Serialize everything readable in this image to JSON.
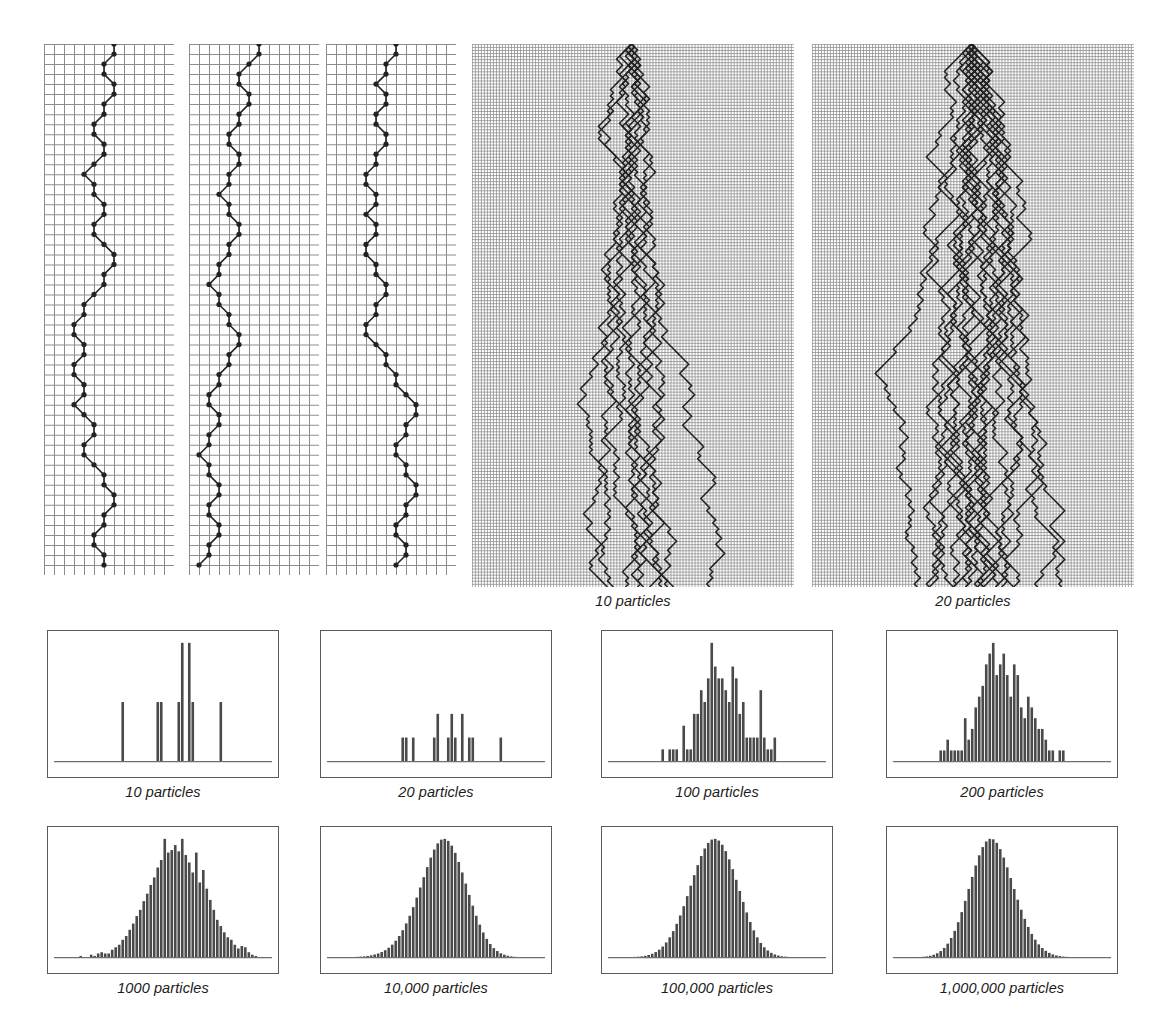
{
  "figure": {
    "ink_color": "#222222",
    "grid_color": "#8c8c8c",
    "bar_color": "#4a4a4a",
    "frame_color": "#5a5a5a",
    "baseline_color": "#6e6e6e"
  },
  "walk_panels": [
    {
      "name": "single-walk-1",
      "caption": "",
      "particles": 1,
      "grid_cols": 13,
      "grid_rows": 53,
      "cell": 10,
      "path": [
        7,
        7,
        6,
        6,
        7,
        7,
        6,
        6,
        5,
        5,
        6,
        6,
        5,
        4,
        5,
        5,
        6,
        6,
        5,
        5,
        6,
        7,
        7,
        6,
        6,
        5,
        4,
        4,
        3,
        3,
        4,
        4,
        3,
        3,
        4,
        4,
        3,
        4,
        5,
        5,
        4,
        4,
        5,
        6,
        6,
        7,
        7,
        6,
        6,
        5,
        5,
        6,
        6
      ]
    },
    {
      "name": "single-walk-2",
      "caption": "",
      "particles": 1,
      "grid_cols": 13,
      "grid_rows": 53,
      "cell": 10,
      "path": [
        7,
        7,
        6,
        5,
        5,
        6,
        6,
        5,
        5,
        4,
        4,
        5,
        5,
        4,
        4,
        3,
        4,
        4,
        5,
        5,
        4,
        4,
        3,
        3,
        2,
        3,
        3,
        4,
        4,
        5,
        5,
        4,
        4,
        3,
        3,
        2,
        2,
        3,
        3,
        2,
        2,
        1,
        2,
        2,
        3,
        3,
        2,
        2,
        3,
        3,
        2,
        2,
        1
      ]
    },
    {
      "name": "single-walk-3",
      "caption": "",
      "particles": 1,
      "grid_cols": 13,
      "grid_rows": 53,
      "cell": 10,
      "path": [
        7,
        7,
        6,
        6,
        5,
        6,
        6,
        5,
        5,
        6,
        6,
        5,
        5,
        4,
        4,
        5,
        5,
        4,
        5,
        5,
        4,
        4,
        5,
        5,
        6,
        6,
        5,
        5,
        4,
        4,
        5,
        6,
        6,
        7,
        7,
        8,
        9,
        9,
        8,
        8,
        7,
        7,
        8,
        8,
        9,
        9,
        8,
        8,
        7,
        7,
        8,
        8,
        7
      ]
    },
    {
      "name": "multi-walk-10",
      "caption": "10 particles",
      "particles": 10,
      "grid_cols": 107,
      "grid_rows": 178,
      "cell": 3
    },
    {
      "name": "multi-walk-20",
      "caption": "20 particles",
      "particles": 20,
      "grid_cols": 107,
      "grid_rows": 178,
      "cell": 3
    }
  ],
  "histograms": [
    {
      "name": "histogram-10",
      "caption": "10 particles",
      "particles": 10,
      "bar_width": 3,
      "values": [
        0,
        0,
        0,
        0,
        0,
        0,
        0,
        0,
        0,
        0,
        0,
        0,
        0,
        0,
        0,
        0,
        0,
        0,
        1,
        0,
        0,
        0,
        0,
        0,
        0,
        0,
        0,
        0,
        1,
        1,
        0,
        0,
        0,
        0,
        1,
        2,
        0,
        2,
        1,
        0,
        0,
        0,
        0,
        0,
        0,
        0,
        1,
        0,
        0,
        0,
        0,
        0,
        0,
        0,
        0,
        0,
        0,
        0,
        0,
        0
      ],
      "ymax": 2
    },
    {
      "name": "histogram-20",
      "caption": "20 particles",
      "particles": 20,
      "bar_width": 3,
      "values": [
        0,
        0,
        0,
        0,
        0,
        0,
        0,
        0,
        0,
        0,
        0,
        0,
        0,
        0,
        0,
        0,
        0,
        0,
        0,
        0,
        1,
        1,
        0,
        1,
        0,
        0,
        0,
        0,
        0,
        1,
        2,
        0,
        0,
        1,
        2,
        1,
        0,
        2,
        0,
        1,
        1,
        0,
        0,
        0,
        0,
        0,
        0,
        0,
        1,
        0,
        0,
        0,
        0,
        0,
        0,
        0,
        0,
        0,
        0,
        0
      ],
      "ymax": 5
    },
    {
      "name": "histogram-100",
      "caption": "100 particles",
      "particles": 100,
      "bar_width": 3,
      "values": [
        0,
        0,
        0,
        0,
        0,
        0,
        0,
        0,
        0,
        0,
        0,
        0,
        0,
        0,
        1,
        0,
        1,
        1,
        1,
        0,
        3,
        1,
        1,
        4,
        4,
        6,
        5,
        7,
        10,
        8,
        7,
        7,
        6,
        5,
        8,
        7,
        4,
        5,
        2,
        2,
        2,
        2,
        6,
        2,
        1,
        1,
        2,
        0,
        0,
        0,
        0,
        0,
        0,
        0,
        0,
        0,
        0,
        0,
        0,
        0
      ],
      "ymax": 10
    },
    {
      "name": "histogram-200",
      "caption": "200 particles",
      "particles": 200,
      "bar_width": 3,
      "values": [
        0,
        0,
        0,
        0,
        0,
        0,
        0,
        0,
        0,
        0,
        0,
        0,
        1,
        1,
        2,
        1,
        1,
        1,
        1,
        4,
        2,
        3,
        5,
        6,
        7,
        9,
        10,
        11,
        8,
        9,
        10,
        8,
        6,
        9,
        8,
        5,
        4,
        6,
        5,
        4,
        3,
        3,
        2,
        1,
        1,
        0,
        1,
        1,
        0,
        0,
        0,
        0,
        0,
        0,
        0,
        0,
        0,
        0,
        0,
        0
      ],
      "ymax": 11
    },
    {
      "name": "histogram-1000",
      "caption": "1000 particles",
      "particles": 1000,
      "bar_width": 5,
      "values": [
        0,
        0,
        0,
        0,
        0,
        0,
        1,
        0,
        0,
        2,
        1,
        3,
        4,
        3,
        3,
        6,
        8,
        10,
        14,
        17,
        22,
        27,
        33,
        38,
        45,
        51,
        58,
        64,
        72,
        78,
        95,
        84,
        86,
        90,
        85,
        95,
        82,
        76,
        68,
        84,
        60,
        70,
        55,
        46,
        38,
        30,
        25,
        20,
        16,
        14,
        10,
        7,
        9,
        8,
        4,
        2,
        1,
        0,
        0,
        0
      ],
      "ymax": 95
    },
    {
      "name": "histogram-10000",
      "caption": "10,000 particles",
      "particles": 10000,
      "bar_width": 5,
      "values": [
        0,
        0,
        0,
        0,
        0,
        1,
        1,
        2,
        3,
        4,
        6,
        9,
        13,
        18,
        25,
        34,
        46,
        61,
        80,
        103,
        131,
        164,
        201,
        243,
        289,
        338,
        388,
        437,
        483,
        522,
        552,
        570,
        574,
        564,
        541,
        506,
        462,
        411,
        357,
        302,
        250,
        201,
        158,
        120,
        89,
        64,
        44,
        30,
        19,
        12,
        7,
        4,
        2,
        1,
        1,
        0,
        0,
        0,
        0,
        0
      ],
      "ymax": 574
    },
    {
      "name": "histogram-100000",
      "caption": "100,000 particles",
      "particles": 100000,
      "bar_width": 5,
      "values": [
        0,
        0,
        1,
        1,
        2,
        4,
        7,
        12,
        20,
        33,
        52,
        80,
        120,
        175,
        248,
        343,
        462,
        606,
        776,
        970,
        1186,
        1419,
        1662,
        1906,
        2139,
        2350,
        2526,
        2656,
        2732,
        2750,
        2710,
        2613,
        2465,
        2272,
        2046,
        1798,
        1540,
        1285,
        1040,
        818,
        624,
        462,
        332,
        231,
        156,
        102,
        64,
        39,
        23,
        13,
        7,
        3,
        2,
        1,
        0,
        0,
        0,
        0,
        0,
        0
      ],
      "ymax": 2750
    },
    {
      "name": "histogram-1000000",
      "caption": "1,000,000 particles",
      "particles": 1000000,
      "bar_width": 5,
      "values": [
        0,
        1,
        2,
        5,
        11,
        23,
        45,
        85,
        154,
        268,
        450,
        728,
        1138,
        1720,
        2516,
        3562,
        4887,
        6492,
        8358,
        10438,
        12648,
        14878,
        17003,
        18890,
        20410,
        21450,
        21940,
        21850,
        21200,
        20040,
        18480,
        16650,
        14670,
        12640,
        10660,
        8800,
        7110,
        5610,
        4320,
        3250,
        2380,
        1700,
        1180,
        800,
        525,
        334,
        206,
        123,
        72,
        40,
        22,
        11,
        6,
        3,
        1,
        0,
        0,
        0,
        0,
        0
      ],
      "ymax": 21940
    }
  ]
}
